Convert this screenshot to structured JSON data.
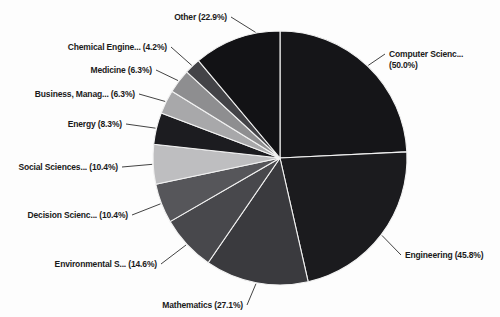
{
  "window": {
    "width": 500,
    "height": 317,
    "background": "#fdfdfd"
  },
  "chart_data": {
    "type": "pie",
    "title": "",
    "legend_position": "callout-labels",
    "value_unit": "%",
    "center": {
      "x": 280,
      "y": 158
    },
    "radius": 127,
    "start_angle_deg": 0,
    "direction": "clockwise",
    "separator_color": "#f2f2f2",
    "leader_color": "#2e2e2e",
    "label_color": "#1a1a1a",
    "label_line_gap": 11,
    "slices": [
      {
        "id": "computer-science",
        "label": "Computer Scienc...",
        "pct": 50.0,
        "pct_label": "(50.0%)",
        "two_line": true,
        "color": "#151518",
        "label_pos": {
          "x": 389,
          "y": 57,
          "anchor": "start"
        }
      },
      {
        "id": "engineering",
        "label": "Engineering",
        "pct": 45.8,
        "pct_label": "(45.8%)",
        "display": "Engineering (45.8%)",
        "color": "#1b1b1e",
        "label_pos": {
          "x": 405,
          "y": 258,
          "anchor": "start"
        }
      },
      {
        "id": "mathematics",
        "label": "Mathematics",
        "pct": 27.1,
        "pct_label": "(27.1%)",
        "display": "Mathematics (27.1%)",
        "color": "#3a3a3e",
        "label_pos": {
          "x": 243,
          "y": 308,
          "anchor": "end"
        }
      },
      {
        "id": "environmental-science",
        "label": "Environmental S...",
        "pct": 14.6,
        "pct_label": "(14.6%)",
        "display": "Environmental S... (14.6%)",
        "color": "#48484c",
        "label_pos": {
          "x": 157,
          "y": 267,
          "anchor": "end"
        }
      },
      {
        "id": "decision-sciences",
        "label": "Decision Scienc...",
        "pct": 10.4,
        "pct_label": "(10.4%)",
        "display": "Decision Scienc... (10.4%)",
        "color": "#56565a",
        "label_pos": {
          "x": 128,
          "y": 218,
          "anchor": "end"
        }
      },
      {
        "id": "social-sciences",
        "label": "Social Sciences...",
        "pct": 10.4,
        "pct_label": "(10.4%)",
        "display": "Social Sciences... (10.4%)",
        "color": "#bebec0",
        "label_pos": {
          "x": 118,
          "y": 170,
          "anchor": "end"
        }
      },
      {
        "id": "energy",
        "label": "Energy",
        "pct": 8.3,
        "pct_label": "(8.3%)",
        "display": "Energy (8.3%)",
        "color": "#1c1c20",
        "label_pos": {
          "x": 122,
          "y": 127,
          "anchor": "end"
        }
      },
      {
        "id": "business-management",
        "label": "Business, Manag...",
        "pct": 6.3,
        "pct_label": "(6.3%)",
        "display": "Business, Manag... (6.3%)",
        "color": "#a8a8aa",
        "label_pos": {
          "x": 135,
          "y": 97,
          "anchor": "end"
        }
      },
      {
        "id": "medicine",
        "label": "Medicine",
        "pct": 6.3,
        "pct_label": "(6.3%)",
        "display": "Medicine (6.3%)",
        "color": "#8e8e90",
        "label_pos": {
          "x": 152,
          "y": 73,
          "anchor": "end"
        }
      },
      {
        "id": "chemical-engineering",
        "label": "Chemical Engine...",
        "pct": 4.2,
        "pct_label": "(4.2%)",
        "display": "Chemical Engine... (4.2%)",
        "color": "#434347",
        "label_pos": {
          "x": 167,
          "y": 50,
          "anchor": "end"
        }
      },
      {
        "id": "other",
        "label": "Other",
        "pct": 22.9,
        "pct_label": "(22.9%)",
        "display": "Other (22.9%)",
        "color": "#121215",
        "label_pos": {
          "x": 227,
          "y": 20,
          "anchor": "end"
        },
        "leader_theta": 349
      }
    ]
  }
}
